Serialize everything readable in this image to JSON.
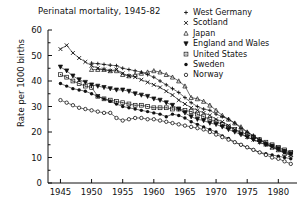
{
  "chart_data": {
    "type": "line",
    "title": "Perinatal mortality, 1945-82",
    "xlabel": "",
    "ylabel": "Rate per 1000 births",
    "xlim": [
      1943,
      1983
    ],
    "ylim": [
      0,
      60
    ],
    "xticks": [
      1945,
      1950,
      1955,
      1960,
      1965,
      1970,
      1975,
      1980
    ],
    "yticks": [
      0,
      10,
      20,
      30,
      40,
      50,
      60
    ],
    "grid": false,
    "legend_position": "top-right",
    "series": [
      {
        "name": "West Germany",
        "marker": "plus",
        "x": [
          1950,
          1951,
          1952,
          1953,
          1954,
          1955,
          1956,
          1957,
          1958,
          1959,
          1960,
          1961,
          1962,
          1963,
          1964,
          1965,
          1966,
          1967,
          1968,
          1969,
          1970,
          1971,
          1972,
          1973,
          1974,
          1975,
          1976,
          1977,
          1978,
          1979,
          1980,
          1981,
          1982
        ],
        "y": [
          47.0,
          46.8,
          46.5,
          46.2,
          46.0,
          45.0,
          44.5,
          44.0,
          43.5,
          42.5,
          41.5,
          40.0,
          38.5,
          37.0,
          35.5,
          33.5,
          31.5,
          30.0,
          29.0,
          28.5,
          27.0,
          26.0,
          25.0,
          23.5,
          21.5,
          20.0,
          18.5,
          17.0,
          15.5,
          14.5,
          13.0,
          12.0,
          11.5
        ]
      },
      {
        "name": "Scotland",
        "marker": "cross",
        "x": [
          1945,
          1946,
          1947,
          1948,
          1949,
          1950,
          1951,
          1952,
          1953,
          1954,
          1955,
          1956,
          1957,
          1958,
          1959,
          1960,
          1961,
          1962,
          1963,
          1964,
          1965,
          1966,
          1967,
          1968,
          1969,
          1970,
          1971,
          1972,
          1973,
          1974,
          1975,
          1976,
          1977,
          1978,
          1979,
          1980,
          1981,
          1982
        ],
        "y": [
          52.5,
          54.0,
          51.0,
          49.0,
          47.5,
          46.0,
          45.0,
          44.5,
          44.0,
          44.5,
          43.0,
          42.0,
          41.5,
          40.5,
          39.5,
          38.5,
          37.5,
          36.0,
          34.5,
          32.5,
          31.0,
          29.5,
          28.5,
          27.5,
          26.5,
          25.0,
          24.0,
          22.5,
          21.0,
          19.5,
          18.0,
          17.0,
          16.0,
          15.0,
          14.0,
          13.0,
          12.0,
          11.0
        ]
      },
      {
        "name": "Japan",
        "marker": "tri-up",
        "x": [
          1950,
          1951,
          1952,
          1953,
          1954,
          1955,
          1956,
          1957,
          1958,
          1959,
          1960,
          1961,
          1962,
          1963,
          1964,
          1965,
          1966,
          1967,
          1968,
          1969,
          1970,
          1971,
          1972,
          1973,
          1974,
          1975,
          1976,
          1977,
          1978,
          1979,
          1980,
          1981,
          1982
        ],
        "y": [
          44.5,
          44.5,
          44.5,
          44.0,
          44.0,
          42.5,
          42.0,
          42.5,
          43.0,
          43.5,
          44.0,
          43.5,
          42.5,
          41.5,
          40.0,
          38.0,
          33.5,
          33.0,
          32.0,
          30.5,
          28.5,
          26.5,
          25.0,
          23.5,
          22.0,
          20.0,
          18.5,
          17.0,
          15.5,
          14.0,
          13.0,
          11.5,
          11.0
        ]
      },
      {
        "name": "England and Wales",
        "marker": "tri-down",
        "x": [
          1945,
          1946,
          1947,
          1948,
          1949,
          1950,
          1951,
          1952,
          1953,
          1954,
          1955,
          1956,
          1957,
          1958,
          1959,
          1960,
          1961,
          1962,
          1963,
          1964,
          1965,
          1966,
          1967,
          1968,
          1969,
          1970,
          1971,
          1972,
          1973,
          1974,
          1975,
          1976,
          1977,
          1978,
          1979,
          1980,
          1981,
          1982
        ],
        "y": [
          45.5,
          44.0,
          42.0,
          40.5,
          39.5,
          38.5,
          38.0,
          37.5,
          37.0,
          36.5,
          36.5,
          36.0,
          35.0,
          34.5,
          34.0,
          33.0,
          32.5,
          31.5,
          30.5,
          29.0,
          27.5,
          26.0,
          25.0,
          24.5,
          23.5,
          23.0,
          22.0,
          21.0,
          20.0,
          19.0,
          18.0,
          17.0,
          16.0,
          15.0,
          14.5,
          13.5,
          12.5,
          11.5
        ]
      },
      {
        "name": "United States",
        "marker": "square-dot",
        "x": [
          1945,
          1946,
          1947,
          1948,
          1949,
          1950,
          1951,
          1952,
          1953,
          1954,
          1955,
          1956,
          1957,
          1958,
          1959,
          1960,
          1961,
          1962,
          1963,
          1964,
          1965,
          1966,
          1967,
          1968,
          1969,
          1970,
          1971,
          1972,
          1973,
          1974,
          1975,
          1976,
          1977,
          1978,
          1979,
          1980,
          1981,
          1982
        ],
        "y": [
          42.5,
          41.5,
          40.0,
          39.0,
          38.0,
          37.5,
          34.0,
          33.0,
          32.5,
          32.0,
          31.5,
          31.0,
          30.5,
          30.5,
          30.0,
          29.5,
          29.5,
          29.5,
          29.0,
          29.0,
          28.5,
          28.0,
          27.0,
          26.0,
          25.0,
          24.0,
          23.0,
          22.0,
          21.0,
          20.0,
          19.0,
          18.0,
          17.0,
          16.0,
          15.0,
          14.0,
          13.0,
          12.0
        ]
      },
      {
        "name": "Sweden",
        "marker": "filled-circle",
        "x": [
          1945,
          1946,
          1947,
          1948,
          1949,
          1950,
          1951,
          1952,
          1953,
          1954,
          1955,
          1956,
          1957,
          1958,
          1959,
          1960,
          1961,
          1962,
          1963,
          1964,
          1965,
          1966,
          1967,
          1968,
          1969,
          1970,
          1971,
          1972,
          1973,
          1974,
          1975,
          1976,
          1977,
          1978,
          1979,
          1980,
          1981,
          1982
        ],
        "y": [
          39.0,
          38.0,
          37.0,
          36.5,
          36.0,
          35.0,
          34.0,
          33.0,
          32.0,
          31.0,
          30.0,
          29.5,
          29.0,
          28.5,
          28.0,
          27.5,
          27.0,
          26.0,
          27.0,
          26.5,
          25.5,
          24.0,
          23.0,
          22.0,
          21.0,
          20.0,
          18.5,
          17.5,
          16.0,
          15.0,
          14.0,
          13.0,
          12.0,
          11.5,
          11.0,
          10.5,
          10.0,
          9.5
        ]
      },
      {
        "name": "Norway",
        "marker": "open-circle",
        "x": [
          1945,
          1946,
          1947,
          1948,
          1949,
          1950,
          1951,
          1952,
          1953,
          1954,
          1955,
          1956,
          1957,
          1958,
          1959,
          1960,
          1961,
          1962,
          1963,
          1964,
          1965,
          1966,
          1967,
          1968,
          1969,
          1970,
          1971,
          1972,
          1973,
          1974,
          1975,
          1976,
          1977,
          1978,
          1979,
          1980,
          1981,
          1982
        ],
        "y": [
          32.5,
          31.5,
          30.5,
          29.5,
          29.0,
          28.5,
          28.0,
          27.5,
          27.5,
          25.5,
          24.5,
          25.0,
          25.5,
          25.5,
          25.0,
          25.0,
          24.5,
          24.0,
          23.5,
          23.0,
          22.5,
          22.0,
          21.5,
          21.0,
          20.0,
          19.0,
          18.0,
          17.0,
          16.0,
          15.0,
          14.0,
          13.0,
          12.0,
          11.0,
          10.0,
          9.5,
          8.5,
          7.5
        ]
      }
    ]
  },
  "legend": {
    "items": [
      {
        "label": "West Germany",
        "marker": "plus"
      },
      {
        "label": "Scotland",
        "marker": "cross"
      },
      {
        "label": "Japan",
        "marker": "tri-up"
      },
      {
        "label": "England and Wales",
        "marker": "tri-down"
      },
      {
        "label": "United States",
        "marker": "square-dot"
      },
      {
        "label": "Sweden",
        "marker": "filled-circle"
      },
      {
        "label": "Norway",
        "marker": "open-circle"
      }
    ]
  },
  "colors": {
    "ink": "#111111",
    "background": "#ffffff"
  }
}
